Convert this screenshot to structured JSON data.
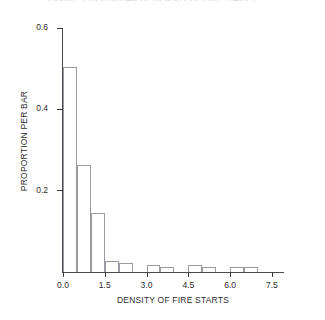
{
  "chart_data": {
    "type": "bar",
    "title": "FIGURE 3. HISTOGRAM OF DENSITY OF FIRE STARTS",
    "xlabel": "DENSITY OF FIRE STARTS",
    "ylabel": "PROPORTION PER BAR",
    "xlim": [
      0.0,
      7.9
    ],
    "ylim": [
      0.0,
      0.6
    ],
    "xticks": [
      "0.0",
      "1.5",
      "3.0",
      "4.5",
      "6.0",
      "7.5"
    ],
    "xtick_values": [
      0.0,
      1.5,
      3.0,
      4.5,
      6.0,
      7.5
    ],
    "yticks": [
      "0.2",
      "0.4",
      "0.6"
    ],
    "ytick_values": [
      0.2,
      0.4,
      0.6
    ],
    "grid": false,
    "legend": false,
    "bin_width": 0.5,
    "bin_starts": [
      0.0,
      0.5,
      1.0,
      1.5,
      2.0,
      2.5,
      3.0,
      3.5,
      4.0,
      4.5,
      5.0,
      5.5,
      6.0,
      6.5
    ],
    "categories": [
      "0.0-0.5",
      "0.5-1.0",
      "1.0-1.5",
      "1.5-2.0",
      "2.0-2.5",
      "2.5-3.0",
      "3.0-3.5",
      "3.5-4.0",
      "4.0-4.5",
      "4.5-5.0",
      "5.0-5.5",
      "5.5-6.0",
      "6.0-6.5",
      "6.5-7.0"
    ],
    "values": [
      0.505,
      0.262,
      0.145,
      0.028,
      0.022,
      0.0,
      0.018,
      0.013,
      0.0,
      0.018,
      0.013,
      0.0,
      0.012,
      0.012
    ],
    "bar_color": "#ffffff",
    "bar_edge_color": "#9a9aa2",
    "axis_color": "#4a4a4a"
  },
  "figure": {
    "background": "#ffffff"
  }
}
